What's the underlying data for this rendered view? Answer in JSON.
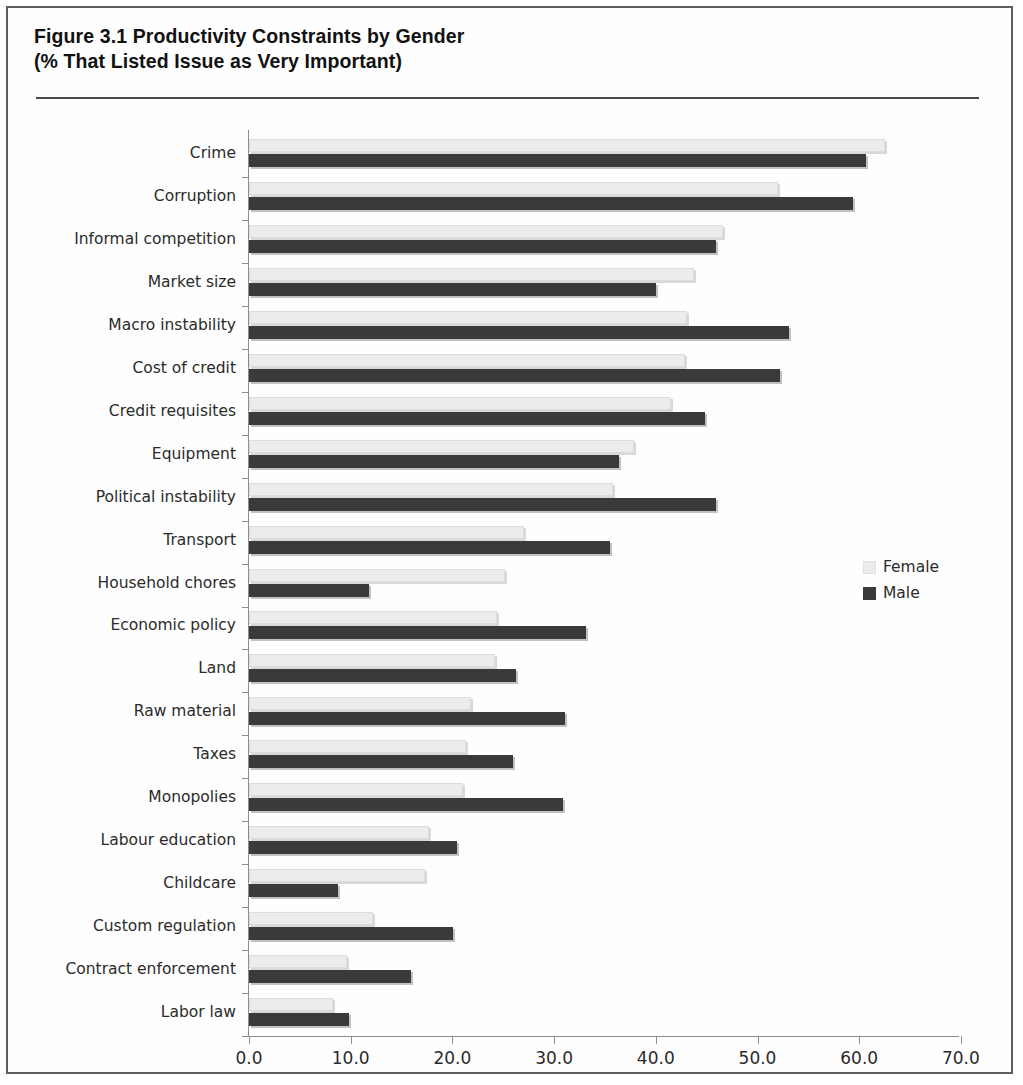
{
  "figure": {
    "title_line1": "Figure 3.1 Productivity Constraints by Gender",
    "title_line2": "(% That Listed Issue as Very Important)"
  },
  "legend": {
    "position": "right",
    "entries": [
      {
        "label": "Female",
        "color": "#ececec"
      },
      {
        "label": "Male",
        "color": "#3a3a3a"
      }
    ]
  },
  "axis": {
    "x_ticks": [
      "0.0",
      "10.0",
      "20.0",
      "30.0",
      "40.0",
      "50.0",
      "60.0",
      "70.0"
    ]
  },
  "chart_data": {
    "type": "bar",
    "orientation": "horizontal",
    "title": "Figure 3.1 Productivity Constraints by Gender (% That Listed Issue as Very Important)",
    "xlabel": "",
    "ylabel": "",
    "xlim": [
      0,
      70
    ],
    "xticks": [
      0,
      10,
      20,
      30,
      40,
      50,
      60,
      70
    ],
    "grid": false,
    "legend_position": "right",
    "categories": [
      "Crime",
      "Corruption",
      "Informal competition",
      "Market size",
      "Macro instability",
      "Cost of credit",
      "Credit requisites",
      "Equipment",
      "Political instability",
      "Transport",
      "Household chores",
      "Economic policy",
      "Land",
      "Raw material",
      "Taxes",
      "Monopolies",
      "Labour education",
      "Childcare",
      "Custom regulation",
      "Contract enforcement",
      "Labor law"
    ],
    "series": [
      {
        "name": "Female",
        "color": "#ececec",
        "values": [
          62.5,
          52.0,
          46.6,
          43.8,
          43.1,
          42.9,
          41.5,
          37.9,
          35.8,
          27.0,
          25.2,
          24.4,
          24.2,
          21.8,
          21.3,
          21.0,
          17.7,
          17.3,
          12.2,
          9.6,
          8.3
        ]
      },
      {
        "name": "Male",
        "color": "#3a3a3a",
        "values": [
          60.7,
          59.4,
          45.9,
          40.0,
          53.1,
          52.2,
          44.8,
          36.4,
          45.9,
          35.5,
          11.8,
          33.1,
          26.3,
          31.1,
          26.0,
          30.9,
          20.5,
          8.8,
          20.1,
          15.9,
          9.8
        ]
      }
    ]
  }
}
